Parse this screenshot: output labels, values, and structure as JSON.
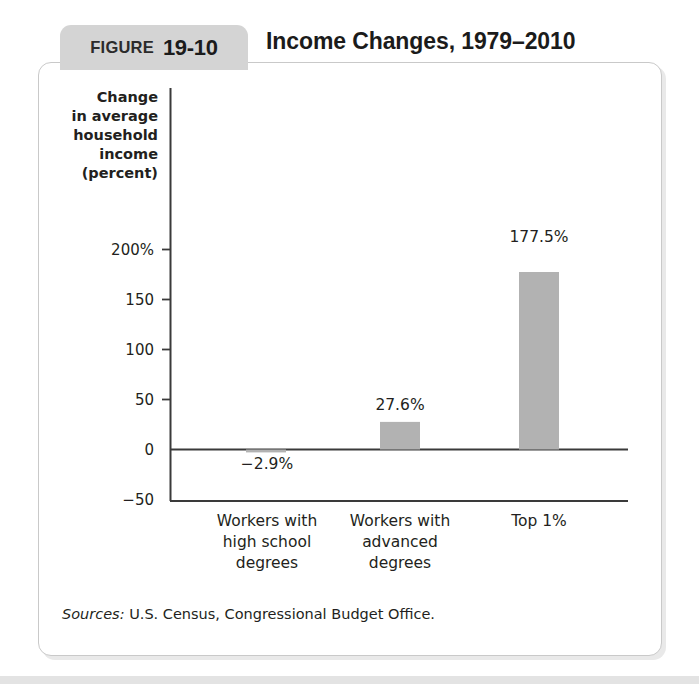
{
  "figure": {
    "label_word": "FIGURE",
    "number": "19-10",
    "title": "Income Changes, 1979–2010"
  },
  "source": {
    "label": "Sources:",
    "text": " U.S. Census, Congressional Budget Office."
  },
  "colors": {
    "bar_fill": "#b2b2b2",
    "tab_background": "#d4d4d4",
    "card_border": "#c9c9c9",
    "axis": "#3a3a3a",
    "text": "#231f20"
  },
  "chart_data": {
    "type": "bar",
    "title": "Income Changes, 1979–2010",
    "xlabel": "",
    "ylabel": "Change in average household income (percent)",
    "ylabel_lines": [
      "Change",
      "in average",
      "household",
      "income",
      "(percent)"
    ],
    "categories": [
      "Workers with high school degrees",
      "Workers with advanced degrees",
      "Top 1%"
    ],
    "category_lines": [
      [
        "Workers with",
        "high school",
        "degrees"
      ],
      [
        "Workers with",
        "advanced",
        "degrees"
      ],
      [
        "Top 1%"
      ]
    ],
    "values": [
      -2.9,
      27.6,
      177.5
    ],
    "value_labels": [
      "−2.9%",
      "27.6%",
      "177.5%"
    ],
    "ylim": [
      -50,
      215
    ],
    "yticks": [
      200,
      150,
      100,
      50,
      0,
      -50
    ],
    "ytick_labels": [
      "200%",
      "150",
      "100",
      "50",
      "0",
      "−50"
    ],
    "grid": false,
    "legend": null
  }
}
